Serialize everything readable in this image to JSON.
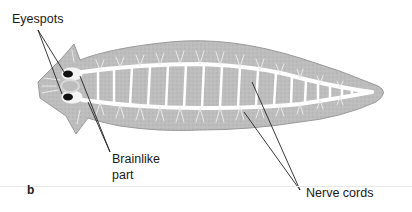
{
  "figure": {
    "panel_letter": "b",
    "labels": {
      "eyespots": "Eyespots",
      "brain_line1": "Brainlike",
      "brain_line2": "part",
      "nerve_cords": "Nerve cords"
    },
    "colors": {
      "body_fill": "#bdbdbd",
      "body_edge": "#9a9a9a",
      "nerve": "#ffffff",
      "eyespot": "#111111",
      "leader_line": "#222222"
    }
  }
}
